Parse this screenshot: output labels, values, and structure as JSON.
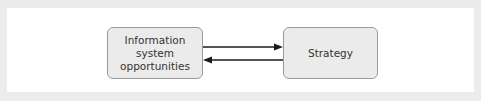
{
  "diagram": {
    "type": "flow",
    "nodes": [
      {
        "id": "information-system-opportunities",
        "label_lines": [
          "Information",
          "system",
          "opportunities"
        ]
      },
      {
        "id": "strategy",
        "label_lines": [
          "Strategy"
        ]
      }
    ],
    "edges": [
      {
        "from": "information-system-opportunities",
        "to": "strategy",
        "direction": "right"
      },
      {
        "from": "strategy",
        "to": "information-system-opportunities",
        "direction": "left"
      }
    ],
    "colors": {
      "node_fill": "#ebebeb",
      "node_border": "#9a9a9a",
      "arrow": "#1a1a1a",
      "frame": "#ececec",
      "background": "#ffffff"
    }
  }
}
